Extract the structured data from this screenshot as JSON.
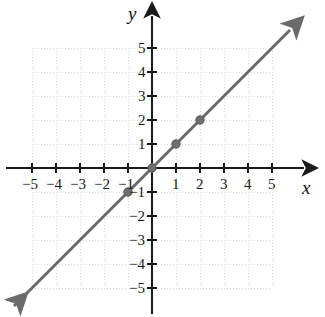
{
  "chart_data": {
    "type": "line",
    "title": "",
    "xlabel": "x",
    "ylabel": "y",
    "grid": true,
    "legend": "none",
    "xlim": [
      -5.9,
      5.9
    ],
    "ylim": [
      -5.9,
      5.9
    ],
    "xticks": [
      -5,
      -4,
      -3,
      -2,
      -1,
      1,
      2,
      3,
      4,
      5
    ],
    "yticks": [
      -5,
      -4,
      -3,
      -2,
      -1,
      1,
      2,
      3,
      4,
      5
    ],
    "xtick_labels": [
      "−5",
      "−4",
      "−3",
      "−2",
      "−1",
      "1",
      "2",
      "3",
      "4",
      "5"
    ],
    "ytick_labels": [
      "−5",
      "−4",
      "−3",
      "−2",
      "−1",
      "1",
      "2",
      "3",
      "4",
      "5"
    ],
    "series": [
      {
        "name": "y = x",
        "equation": "y = x",
        "slope": 1,
        "intercept": 0,
        "color": "#6b6b6b",
        "arrow_start": true,
        "arrow_end": true,
        "x": [
          -5.75,
          5.75
        ],
        "y": [
          -5.75,
          5.75
        ],
        "points": [
          {
            "x": -1,
            "y": -1
          },
          {
            "x": 0,
            "y": 0
          },
          {
            "x": 1,
            "y": 1
          },
          {
            "x": 2,
            "y": 2
          }
        ]
      }
    ],
    "colors": {
      "line": "#6b6b6b",
      "point": "#6f6f6f",
      "axis": "#1a1a1a",
      "grid": "#d8d8d8",
      "background": "#ffffff",
      "text": "#1a1a1a"
    }
  },
  "axes": {
    "x_name": "x",
    "y_name": "y"
  },
  "x_labels": [
    {
      "text": "−5",
      "value": -5
    },
    {
      "text": "−4",
      "value": -4
    },
    {
      "text": "−3",
      "value": -3
    },
    {
      "text": "−2",
      "value": -2
    },
    {
      "text": "−1",
      "value": -1
    },
    {
      "text": "1",
      "value": 1
    },
    {
      "text": "2",
      "value": 2
    },
    {
      "text": "3",
      "value": 3
    },
    {
      "text": "4",
      "value": 4
    },
    {
      "text": "5",
      "value": 5
    }
  ],
  "y_labels": [
    {
      "text": "5",
      "value": 5
    },
    {
      "text": "4",
      "value": 4
    },
    {
      "text": "3",
      "value": 3
    },
    {
      "text": "2",
      "value": 2
    },
    {
      "text": "1",
      "value": 1
    },
    {
      "text": "−1",
      "value": -1
    },
    {
      "text": "−2",
      "value": -2
    },
    {
      "text": "−3",
      "value": -3
    },
    {
      "text": "−4",
      "value": -4
    },
    {
      "text": "−5",
      "value": -5
    }
  ]
}
